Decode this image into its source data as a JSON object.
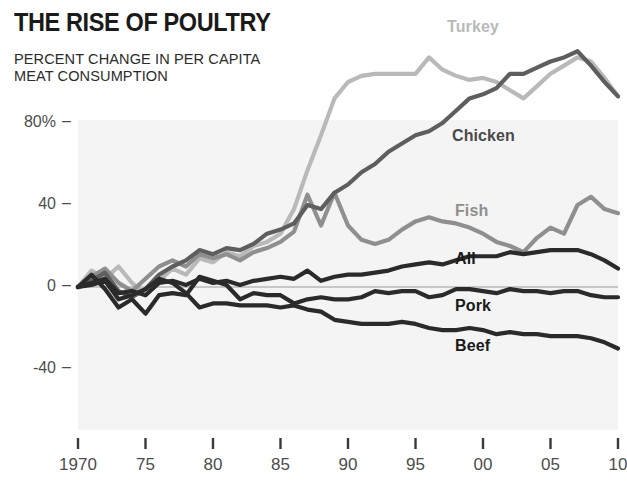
{
  "chart_data": {
    "type": "line",
    "title": "THE RISE OF POULTRY",
    "subtitle": "PERCENT CHANGE IN PER CAPITA\nMEAT CONSUMPTION",
    "xlabel": "",
    "ylabel": "",
    "xlim": [
      1970,
      2010
    ],
    "ylim": [
      -60,
      130
    ],
    "grid": false,
    "legend_position": "inline-labels",
    "x_tick_labels": [
      "1970",
      "75",
      "80",
      "85",
      "90",
      "95",
      "00",
      "05",
      "10"
    ],
    "x_tick_values": [
      1970,
      1975,
      1980,
      1985,
      1990,
      1995,
      2000,
      2005,
      2010
    ],
    "y_tick_labels": [
      "80%",
      "40",
      "0",
      "-40"
    ],
    "y_tick_values": [
      80,
      40,
      0,
      -40
    ],
    "zero_line": 0,
    "x": [
      1970,
      1971,
      1972,
      1973,
      1974,
      1975,
      1976,
      1977,
      1978,
      1979,
      1980,
      1981,
      1982,
      1983,
      1984,
      1985,
      1986,
      1987,
      1988,
      1989,
      1990,
      1991,
      1992,
      1993,
      1994,
      1995,
      1996,
      1997,
      1998,
      1999,
      2000,
      2001,
      2002,
      2003,
      2004,
      2005,
      2006,
      2007,
      2008,
      2009,
      2010
    ],
    "series": [
      {
        "name": "Turkey",
        "color": "#b9b9b9",
        "label_color": "#b9b9b9",
        "values": [
          0,
          8,
          4,
          10,
          2,
          -4,
          3,
          9,
          6,
          14,
          12,
          17,
          15,
          20,
          22,
          26,
          38,
          57,
          74,
          92,
          100,
          103,
          104,
          104,
          104,
          104,
          112,
          106,
          103,
          101,
          102,
          100,
          96,
          92,
          98,
          104,
          108,
          112,
          110,
          102,
          93
        ]
      },
      {
        "name": "Chicken",
        "color": "#5e5e5e",
        "label_color": "#4a4a4a",
        "values": [
          0,
          3,
          7,
          -2,
          -5,
          -1,
          6,
          10,
          13,
          18,
          16,
          19,
          18,
          21,
          26,
          28,
          31,
          40,
          38,
          46,
          50,
          56,
          60,
          66,
          70,
          74,
          76,
          80,
          86,
          92,
          94,
          97,
          104,
          104,
          107,
          110,
          112,
          115,
          108,
          100,
          93
        ]
      },
      {
        "name": "Fish",
        "color": "#8f8f8f",
        "label_color": "#8f8f8f",
        "values": [
          0,
          5,
          9,
          2,
          -2,
          4,
          10,
          13,
          10,
          16,
          14,
          16,
          13,
          17,
          19,
          22,
          27,
          45,
          30,
          46,
          30,
          23,
          21,
          23,
          28,
          32,
          34,
          32,
          31,
          29,
          26,
          22,
          20,
          17,
          24,
          29,
          26,
          40,
          44,
          38,
          36
        ]
      },
      {
        "name": "All",
        "color": "#2a2a2a",
        "label_color": "#1a1a1a",
        "values": [
          0,
          2,
          4,
          -3,
          -2,
          -4,
          2,
          3,
          1,
          4,
          2,
          3,
          1,
          3,
          4,
          5,
          4,
          8,
          3,
          5,
          6,
          6,
          7,
          8,
          10,
          11,
          12,
          11,
          13,
          15,
          15,
          15,
          17,
          16,
          17,
          18,
          18,
          18,
          16,
          13,
          9
        ]
      },
      {
        "name": "Pork",
        "color": "#2a2a2a",
        "label_color": "#1a1a1a",
        "values": [
          0,
          6,
          -1,
          -10,
          -6,
          -13,
          -4,
          -3,
          -4,
          5,
          3,
          1,
          -6,
          -3,
          -4,
          -4,
          -8,
          -6,
          -5,
          -6,
          -6,
          -5,
          -2,
          -3,
          -2,
          -2,
          -5,
          -4,
          -1,
          -1,
          -2,
          -3,
          -1,
          -2,
          -2,
          -3,
          -2,
          -2,
          -4,
          -5,
          -5
        ]
      },
      {
        "name": "Beef",
        "color": "#2a2a2a",
        "label_color": "#1a1a1a",
        "values": [
          0,
          1,
          3,
          -6,
          -4,
          -1,
          4,
          2,
          -3,
          -10,
          -8,
          -8,
          -9,
          -9,
          -9,
          -10,
          -9,
          -11,
          -12,
          -16,
          -17,
          -18,
          -18,
          -18,
          -17,
          -18,
          -20,
          -21,
          -21,
          -20,
          -21,
          -23,
          -22,
          -23,
          -23,
          -24,
          -24,
          -24,
          -25,
          -27,
          -30
        ]
      }
    ],
    "series_label_positions": [
      {
        "name": "Turkey",
        "left": 447,
        "top": 18
      },
      {
        "name": "Chicken",
        "left": 452,
        "top": 127
      },
      {
        "name": "Fish",
        "left": 455,
        "top": 202
      },
      {
        "name": "All",
        "left": 455,
        "top": 250
      },
      {
        "name": "Pork",
        "left": 455,
        "top": 297
      },
      {
        "name": "Beef",
        "left": 455,
        "top": 337
      }
    ]
  },
  "footer": {
    "note": ""
  }
}
